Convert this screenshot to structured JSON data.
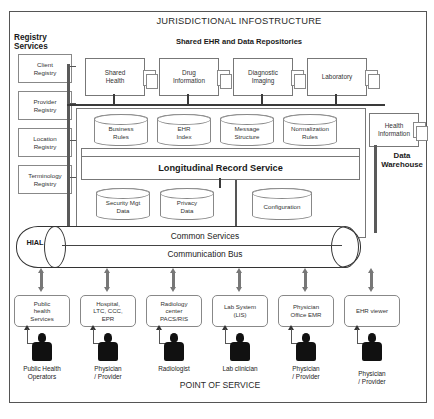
{
  "diagram": {
    "title": "JURISDICTIONAL INFOSTRUCTURE",
    "shared_header": "Shared EHR and Data Repositories",
    "registry_header": "Registry\nServices",
    "data_warehouse_label": "Data\nWarehouse",
    "point_of_service_label": "POINT OF SERVICE",
    "longitudinal_record_service": "Longitudinal Record Service",
    "hial_label": "HIAL",
    "common_services": "Common Services",
    "communication_bus": "Communication Bus"
  },
  "registries": [
    {
      "label": "Client\nRegistry"
    },
    {
      "label": "Provider\nRegistry"
    },
    {
      "label": "Location\nRegistry"
    },
    {
      "label": "Terminology\nRegistry"
    }
  ],
  "repositories": [
    {
      "label": "Shared\nHealth"
    },
    {
      "label": "Drug\nInformation"
    },
    {
      "label": "Diagnostic\nImaging"
    },
    {
      "label": "Laboratory"
    }
  ],
  "health_information": {
    "label": "Health\nInformation"
  },
  "upper_stores": [
    {
      "label": "Business\nRules"
    },
    {
      "label": "EHR\nIndex"
    },
    {
      "label": "Message\nStructure"
    },
    {
      "label": "Normalization\nRules"
    }
  ],
  "lower_stores": [
    {
      "label": "Security Mgt\nData"
    },
    {
      "label": "Privacy\nData"
    },
    {
      "label": "Configuration"
    }
  ],
  "point_of_service": [
    {
      "system": "Public\nhealth\nServices",
      "actor": "Public Health\nOperators"
    },
    {
      "system": "Hospital,\nLTC, CCC,\nEPR",
      "actor": "Physician\n/ Provider"
    },
    {
      "system": "Radiology\ncenter\nPACS/RIS",
      "actor": "Radiologist"
    },
    {
      "system": "Lab System\n(LIS)",
      "actor": "Lab clinician"
    },
    {
      "system": "Physician\nOffice EMR",
      "actor": "Physician\n/ Provider"
    },
    {
      "system": "EHR viewer",
      "actor": "Physician\n/ Provider"
    }
  ],
  "colors": {
    "frame": "#555555",
    "line": "#3a3a3a",
    "arrow": "#777777",
    "person": "#111111",
    "text": "#1a1a1a"
  }
}
